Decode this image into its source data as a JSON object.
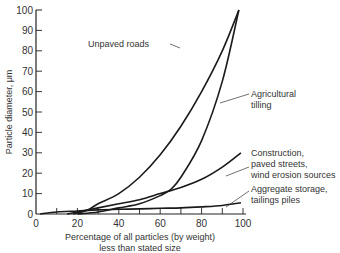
{
  "chart_data": {
    "type": "line",
    "title": "",
    "xlabel": "Percentage of all particles (by weight) less than stated size",
    "xlabel_lines": [
      "Percentage of all particles (by weight)",
      "less than stated size"
    ],
    "ylabel": "Particle diameter, μm",
    "xlim": [
      0,
      100
    ],
    "ylim": [
      0,
      100
    ],
    "xticks": [
      0,
      20,
      40,
      60,
      80,
      100
    ],
    "yticks": [
      0,
      10,
      20,
      30,
      40,
      50,
      60,
      70,
      80,
      90,
      100
    ],
    "grid": false,
    "series": [
      {
        "name": "Unpaved roads",
        "label_lines": [
          "Unpaved roads"
        ],
        "x": [
          18,
          25,
          30,
          40,
          50,
          60,
          70,
          80,
          90,
          98
        ],
        "y": [
          0,
          2,
          5,
          10,
          18,
          29,
          43,
          60,
          80,
          100
        ]
      },
      {
        "name": "Agricultural tilling",
        "label_lines": [
          "Agricultural",
          "tilling"
        ],
        "x": [
          20,
          30,
          40,
          50,
          60,
          65,
          70,
          80,
          90,
          98
        ],
        "y": [
          0,
          1,
          3,
          5,
          9,
          12,
          18,
          36,
          65,
          100
        ]
      },
      {
        "name": "Construction, paved streets, wind erosion sources",
        "label_lines": [
          "Construction,",
          "paved streets,",
          "wind erosion sources"
        ],
        "x": [
          15,
          20,
          30,
          40,
          50,
          60,
          70,
          80,
          90,
          99
        ],
        "y": [
          0,
          1,
          3,
          5,
          7,
          10,
          13,
          17,
          23,
          30
        ]
      },
      {
        "name": "Aggregate storage, tailings piles",
        "label_lines": [
          "Aggregate storage,",
          "tailings piles"
        ],
        "x": [
          2,
          10,
          20,
          30,
          40,
          50,
          60,
          70,
          80,
          90,
          99
        ],
        "y": [
          0,
          1,
          1.5,
          2,
          2.3,
          2.5,
          2.8,
          3,
          3.5,
          4.2,
          5.5
        ]
      }
    ]
  }
}
